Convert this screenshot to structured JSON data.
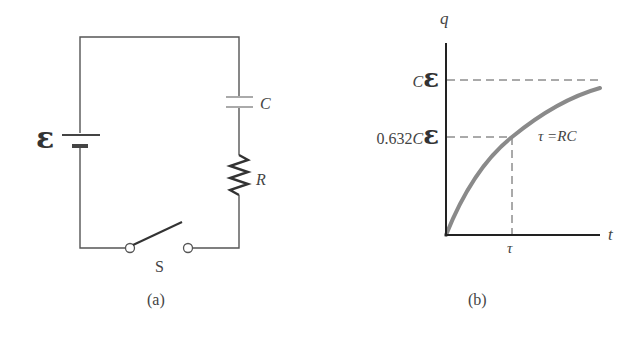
{
  "panel_a": {
    "caption": "(a)",
    "emf_label": "ε",
    "capacitor_label": "C",
    "resistor_label": "R",
    "switch_label": "S"
  },
  "panel_b": {
    "caption": "(b)",
    "y_axis_label": "q",
    "x_axis_label": "t",
    "max_label_prefix": "C",
    "max_label_symbol": "ε",
    "mid_label_prefix": "0.632",
    "mid_label_c": "C",
    "mid_label_symbol": "ε",
    "tau_tick_label": "τ",
    "curve_annotation": "τ =RC"
  },
  "colors": {
    "wire": "#555555",
    "axis": "#222222",
    "curve": "#8a8a8a",
    "capacitor": "#aaaaaa",
    "text": "#333333"
  }
}
